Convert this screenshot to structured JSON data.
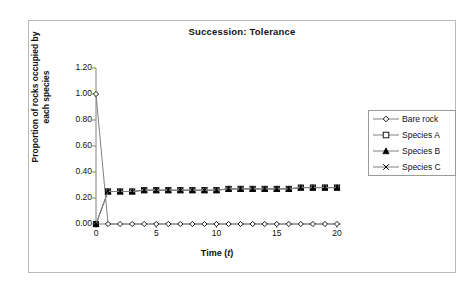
{
  "chart_data": {
    "type": "line",
    "title": "Succession: Tolerance",
    "xlabel": "Time (t)",
    "xlabel_plain": "Time (",
    "xlabel_italic": "t",
    "xlabel_tail": ")",
    "ylabel": "Proportion of rocks occupied by each species",
    "ylabel_line1": "Proportion of rocks occupied by",
    "ylabel_line2": "each species",
    "xlim": [
      0,
      20
    ],
    "ylim": [
      0.0,
      1.2
    ],
    "xticks": [
      0,
      5,
      10,
      15,
      20
    ],
    "xtick_labels": [
      "0",
      "5",
      "10",
      "15",
      "20"
    ],
    "yticks": [
      0.0,
      0.2,
      0.4,
      0.6,
      0.8,
      1.0,
      1.2
    ],
    "ytick_labels": [
      "0.00",
      "0.20",
      "0.40",
      "0.60",
      "0.80",
      "1.00",
      "1.20"
    ],
    "grid": false,
    "legend_position": "right",
    "line_color": "#808080",
    "marker_color": "#000000",
    "x": [
      0,
      1,
      2,
      3,
      4,
      5,
      6,
      7,
      8,
      9,
      10,
      11,
      12,
      13,
      14,
      15,
      16,
      17,
      18,
      19,
      20
    ],
    "series": [
      {
        "name": "Bare rock",
        "marker": "open-diamond",
        "values": [
          1.0,
          0.0,
          0.0,
          0.0,
          0.0,
          0.0,
          0.0,
          0.0,
          0.0,
          0.0,
          0.0,
          0.0,
          0.0,
          0.0,
          0.0,
          0.0,
          0.0,
          0.0,
          0.0,
          0.0,
          0.0
        ]
      },
      {
        "name": "Species A",
        "marker": "open-square",
        "values": [
          0.0,
          0.25,
          0.25,
          0.25,
          0.26,
          0.26,
          0.26,
          0.26,
          0.26,
          0.26,
          0.26,
          0.27,
          0.27,
          0.27,
          0.27,
          0.27,
          0.27,
          0.28,
          0.28,
          0.28,
          0.28
        ]
      },
      {
        "name": "Species B",
        "marker": "filled-triangle",
        "values": [
          0.0,
          0.25,
          0.25,
          0.25,
          0.26,
          0.26,
          0.26,
          0.26,
          0.26,
          0.26,
          0.26,
          0.27,
          0.27,
          0.27,
          0.27,
          0.27,
          0.27,
          0.28,
          0.28,
          0.28,
          0.28
        ]
      },
      {
        "name": "Species C",
        "marker": "cross-x",
        "values": [
          0.0,
          0.25,
          0.25,
          0.25,
          0.26,
          0.26,
          0.26,
          0.26,
          0.26,
          0.26,
          0.26,
          0.27,
          0.27,
          0.27,
          0.27,
          0.27,
          0.27,
          0.28,
          0.28,
          0.28,
          0.28
        ]
      }
    ]
  },
  "legend": {
    "items": [
      {
        "label": "Bare rock"
      },
      {
        "label": "Species A"
      },
      {
        "label": "Species B"
      },
      {
        "label": "Species C"
      }
    ]
  }
}
